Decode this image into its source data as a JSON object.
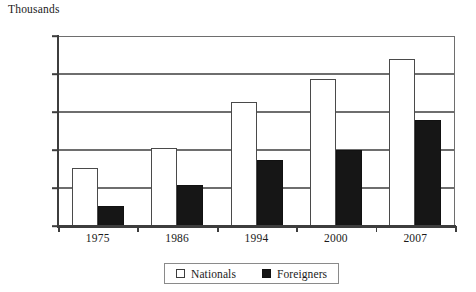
{
  "chart_data": {
    "type": "bar",
    "title": "",
    "unit_caption": "Thousands",
    "xlabel": "",
    "ylabel": "",
    "categories": [
      "1975",
      "1986",
      "1994",
      "2000",
      "2007"
    ],
    "series": [
      {
        "name": "Nationals",
        "color": "#ffffff",
        "values": [
          7600,
          10200,
          16300,
          19300,
          22000
        ]
      },
      {
        "name": "Foreigners",
        "color": "#161616",
        "values": [
          2600,
          5400,
          8700,
          10000,
          14000
        ]
      }
    ],
    "ylim": [
      0,
      25000
    ],
    "ytick_values": [
      0,
      5000,
      10000,
      15000,
      20000,
      25000
    ],
    "ytick_labels": [
      "0",
      "5,000",
      "10,000",
      "15,000",
      "20,000",
      "25,000"
    ],
    "grid": true,
    "legend_position": "bottom-center"
  },
  "legend": {
    "entries": [
      {
        "label": "Nationals",
        "swatch": "white-square-icon"
      },
      {
        "label": "Foreigners",
        "swatch": "black-square-icon"
      }
    ]
  }
}
